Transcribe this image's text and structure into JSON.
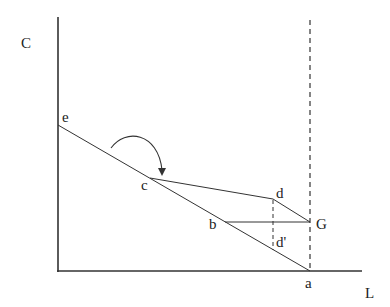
{
  "diagram": {
    "axes": {
      "y_label": "C",
      "x_label": "L"
    },
    "points": {
      "e": "e",
      "c": "c",
      "b": "b",
      "d": "d",
      "d_prime": "d'",
      "G": "G",
      "a": "a"
    },
    "colors": {
      "line": "#333333",
      "background": "#ffffff"
    }
  }
}
